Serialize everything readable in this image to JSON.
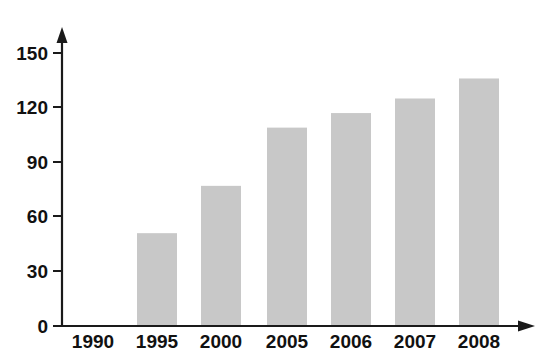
{
  "chart_data": {
    "type": "bar",
    "title": "",
    "subtitle": "",
    "xlabel": "",
    "ylabel": "",
    "categories": [
      "1990",
      "1995",
      "2000",
      "2005",
      "2006",
      "2007",
      "2008"
    ],
    "values": [
      34,
      51,
      77,
      109,
      117,
      125,
      136
    ],
    "series": [
      {
        "name": "",
        "values": [
          34,
          51,
          77,
          109,
          117,
          125,
          136
        ]
      }
    ],
    "ylim": [
      0,
      150
    ],
    "yticks": [
      0,
      30,
      60,
      90,
      120,
      150
    ],
    "ytick_labels": [
      "0",
      "30",
      "60",
      "90",
      "120",
      "150"
    ],
    "xtick_labels": [
      "1990",
      "1995",
      "2000",
      "2005",
      "2006",
      "2007",
      "2008"
    ],
    "grid": false,
    "legend": false,
    "legend_position": "none",
    "annotations": [],
    "axis_arrows": {
      "y_axis": "up-arrow",
      "x_axis": "right-arrow"
    },
    "colors": {
      "bar_fill": "#c8c8c8",
      "axis": "#1a1a1a",
      "tick_label": "#111111",
      "background": "#ffffff"
    }
  }
}
